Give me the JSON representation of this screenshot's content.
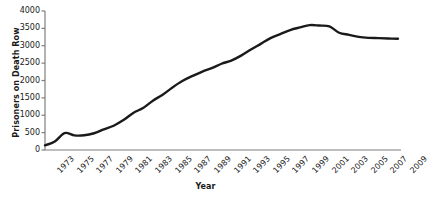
{
  "chart_data": {
    "type": "line",
    "title": "",
    "xlabel": "Year",
    "ylabel": "Prisoners on Death Row",
    "x": [
      1973,
      1974,
      1975,
      1976,
      1977,
      1978,
      1979,
      1980,
      1981,
      1982,
      1983,
      1984,
      1985,
      1986,
      1987,
      1988,
      1989,
      1990,
      1991,
      1992,
      1993,
      1994,
      1995,
      1996,
      1997,
      1998,
      1999,
      2000,
      2001,
      2002,
      2003,
      2004,
      2005,
      2006,
      2007,
      2008,
      2009
    ],
    "values": [
      134,
      244,
      488,
      420,
      423,
      482,
      593,
      697,
      860,
      1066,
      1209,
      1420,
      1591,
      1800,
      1984,
      2124,
      2250,
      2356,
      2482,
      2575,
      2716,
      2890,
      3054,
      3219,
      3335,
      3452,
      3527,
      3593,
      3581,
      3557,
      3374,
      3315,
      3254,
      3228,
      3220,
      3210,
      3200
    ],
    "xlim": [
      1973,
      2009
    ],
    "ylim": [
      0,
      4000
    ],
    "yticks": [
      0,
      500,
      1000,
      1500,
      2000,
      2500,
      3000,
      3500,
      4000
    ],
    "ytick_labels": [
      "0",
      "500",
      "1000",
      "1500",
      "2000",
      "2500",
      "3000",
      "3500",
      "4000"
    ],
    "xticks": [
      1973,
      1975,
      1977,
      1979,
      1981,
      1983,
      1985,
      1987,
      1989,
      1991,
      1993,
      1995,
      1997,
      1999,
      2001,
      2003,
      2005,
      2007,
      2009
    ],
    "xtick_labels": [
      "1973",
      "1975",
      "1977",
      "1979",
      "1981",
      "1983",
      "1985",
      "1987",
      "1989",
      "1991",
      "1993",
      "1995",
      "1997",
      "1999",
      "2001",
      "2003",
      "2005",
      "2007",
      "2009"
    ],
    "grid": false,
    "legend": null,
    "line_color": "#1a1a1a",
    "line_width": 2.4,
    "axis_color": "#7f7f7f",
    "peak_year": 2000,
    "peak_value": 3593
  },
  "axis_titles": {
    "y": "Prisoners on Death Row",
    "x": "Year"
  }
}
